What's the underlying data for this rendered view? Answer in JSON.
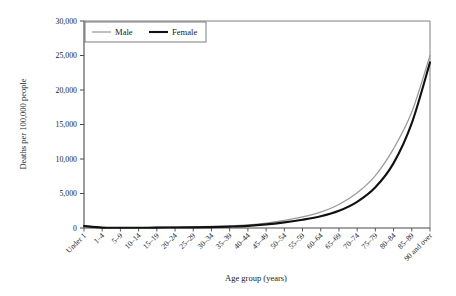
{
  "chart_data": {
    "type": "line",
    "title": "",
    "xlabel": "Age group (years)",
    "ylabel": "Deaths per 100,000 people",
    "categories": [
      "Under 1",
      "1–4",
      "5–9",
      "10–14",
      "15–19",
      "20–24",
      "25–29",
      "30–34",
      "35–39",
      "40–44",
      "45–49",
      "50–54",
      "55–59",
      "60–64",
      "65–69",
      "70–74",
      "75–79",
      "80–84",
      "85–89",
      "90 and over"
    ],
    "series": [
      {
        "name": "Male",
        "color": "#9a9a9a",
        "values": [
          330,
          70,
          40,
          45,
          120,
          180,
          200,
          230,
          300,
          450,
          700,
          1100,
          1600,
          2300,
          3400,
          5100,
          7600,
          11500,
          16800,
          25000
        ]
      },
      {
        "name": "Female",
        "color": "#111111",
        "values": [
          280,
          55,
          30,
          28,
          55,
          70,
          90,
          130,
          200,
          310,
          520,
          820,
          1200,
          1700,
          2500,
          3800,
          5900,
          9400,
          15200,
          24000
        ]
      }
    ],
    "ylim": [
      0,
      30000
    ],
    "ytick_labels": [
      "0",
      "5,000",
      "10,000",
      "15,000",
      "20,000",
      "25,000",
      "30,000"
    ],
    "ytick_values": [
      0,
      5000,
      10000,
      15000,
      20000,
      25000,
      30000
    ],
    "grid": false,
    "legend_position": "top-left-inside",
    "legend_entries": [
      "Male",
      "Female"
    ]
  }
}
